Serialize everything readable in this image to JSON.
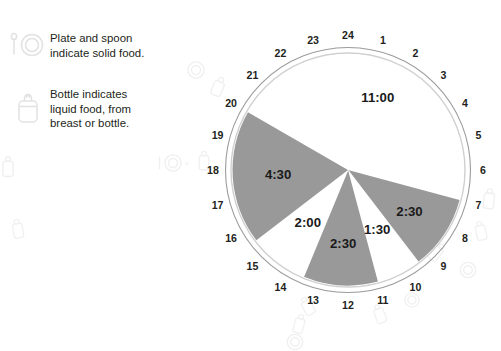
{
  "legend": {
    "items": [
      {
        "icon": "plate-and-spoon-icon",
        "text": "Plate and spoon\nindicate solid food."
      },
      {
        "icon": "baby-bottle-icon",
        "text": "Bottle indicates\nliquid food, from\nbreast or bottle."
      }
    ]
  },
  "colors": {
    "solid_segment": "#999999",
    "liquid_segment": "#ffffff",
    "ring_outer": "#9b9b9b",
    "ring_inner": "#d8d8d8",
    "label_text": "#231f20"
  },
  "clock": {
    "hour_labels": [
      "1",
      "2",
      "3",
      "4",
      "5",
      "6",
      "7",
      "8",
      "9",
      "10",
      "11",
      "12",
      "13",
      "14",
      "15",
      "16",
      "17",
      "18",
      "19",
      "20",
      "21",
      "22",
      "23",
      "24"
    ],
    "segment_labels": [
      "11:00",
      "2:30",
      "1:30",
      "2:30",
      "2:00",
      "4:30"
    ]
  },
  "chart_data": {
    "type": "pie",
    "title": "",
    "subtitle": "",
    "xlabel": "",
    "ylabel": "",
    "legend_position": "left",
    "grid": false,
    "axis_note": "24-hour clock face; hour 24 at top (12 o'clock), hours increase clockwise, 15 degrees per hour",
    "tick_labels": [
      "1",
      "2",
      "3",
      "4",
      "5",
      "6",
      "7",
      "8",
      "9",
      "10",
      "11",
      "12",
      "13",
      "14",
      "15",
      "16",
      "17",
      "18",
      "19",
      "20",
      "21",
      "22",
      "23",
      "24"
    ],
    "categories": [
      "11:00",
      "2:30",
      "1:30",
      "2:30",
      "2:00",
      "4:30"
    ],
    "values": [
      11.0,
      2.5,
      1.5,
      2.5,
      2.0,
      4.5
    ],
    "units": "hours",
    "total": 24,
    "slices": [
      {
        "label": "11:00",
        "hours": 11.0,
        "start_hour": 20.0,
        "end_hour": 31.0,
        "color": "#ffffff",
        "fill": "white"
      },
      {
        "label": "2:30",
        "hours": 2.5,
        "start_hour": 7.0,
        "end_hour": 9.5,
        "color": "#999999",
        "fill": "gray"
      },
      {
        "label": "1:30",
        "hours": 1.5,
        "start_hour": 9.5,
        "end_hour": 11.0,
        "color": "#ffffff",
        "fill": "white"
      },
      {
        "label": "2:30",
        "hours": 2.5,
        "start_hour": 11.0,
        "end_hour": 13.5,
        "color": "#999999",
        "fill": "gray"
      },
      {
        "label": "2:00",
        "hours": 2.0,
        "start_hour": 13.5,
        "end_hour": 15.5,
        "color": "#ffffff",
        "fill": "white"
      },
      {
        "label": "4:30",
        "hours": 4.5,
        "start_hour": 15.5,
        "end_hour": 20.0,
        "color": "#999999",
        "fill": "gray"
      }
    ]
  }
}
